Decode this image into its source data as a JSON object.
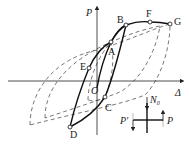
{
  "diagram": {
    "type": "hysteresis-loop",
    "axes": {
      "y_label": "P",
      "x_label": "Δ",
      "origin_label": "O"
    },
    "points": [
      {
        "id": "A",
        "label": "A"
      },
      {
        "id": "B",
        "label": "B"
      },
      {
        "id": "F",
        "label": "F"
      },
      {
        "id": "G",
        "label": "G"
      },
      {
        "id": "E",
        "label": "E"
      },
      {
        "id": "C",
        "label": "C"
      },
      {
        "id": "D",
        "label": "D"
      }
    ],
    "inset": {
      "axial_load_label": "N",
      "axial_load_subscript": "0",
      "force_right_label": "P",
      "force_left_label": "P′"
    },
    "colors": {
      "solid": "#111111",
      "dashed": "#555555",
      "light_arrow": "#aaaaaa"
    }
  }
}
